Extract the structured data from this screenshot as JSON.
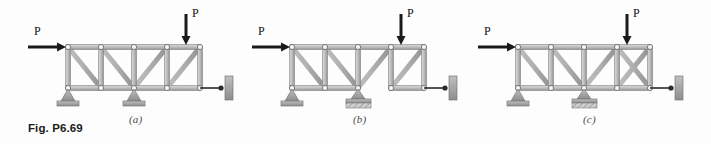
{
  "figure": {
    "caption": "Fig. P6.69",
    "background_color": "#fdfdfd",
    "member_color": "#b9b9b9",
    "member_edge_color": "#7d7d7d",
    "joint_color": "#f2f2f2",
    "support_color": "#9a9a9a",
    "arrow_color": "#1a1a1a"
  },
  "panels": [
    {
      "id": "a",
      "label": "(a)",
      "loads": [
        {
          "name": "horizontal-load",
          "label": "P",
          "direction": "right",
          "applied_at": "top-left-joint"
        },
        {
          "name": "vertical-load",
          "label": "P",
          "direction": "down",
          "applied_at": "top-chord-joint-4"
        }
      ],
      "supports": [
        {
          "type": "pin",
          "position": "bottom-joint-1"
        },
        {
          "type": "pin",
          "position": "bottom-joint-3"
        },
        {
          "type": "link-to-wall",
          "position": "bottom-joint-5"
        }
      ],
      "bottom_chord": "continuous",
      "diagonals": [
        "panel1-down",
        "panel2-down",
        "panel3-up",
        "panel4-up"
      ],
      "verticals": [
        "joint2",
        "joint3",
        "joint4"
      ]
    },
    {
      "id": "b",
      "label": "(b)",
      "loads": [
        {
          "name": "horizontal-load",
          "label": "P",
          "direction": "right",
          "applied_at": "top-left-joint"
        },
        {
          "name": "vertical-load",
          "label": "P",
          "direction": "down",
          "applied_at": "top-chord-joint-4"
        }
      ],
      "supports": [
        {
          "type": "pin",
          "position": "bottom-joint-1"
        },
        {
          "type": "fixed-hatched",
          "position": "bottom-joint-3"
        },
        {
          "type": "link-to-wall",
          "position": "bottom-joint-5"
        }
      ],
      "bottom_chord": "broken-between-joint-3-and-4",
      "diagonals": [
        "panel1-down",
        "panel2-down",
        "panel3-up",
        "panel4-up"
      ],
      "verticals": [
        "joint2",
        "joint3",
        "joint4"
      ]
    },
    {
      "id": "c",
      "label": "(c)",
      "loads": [
        {
          "name": "horizontal-load",
          "label": "P",
          "direction": "right",
          "applied_at": "top-left-joint"
        },
        {
          "name": "vertical-load",
          "label": "P",
          "direction": "down",
          "applied_at": "top-chord-joint-4"
        }
      ],
      "supports": [
        {
          "type": "pin",
          "position": "bottom-joint-1"
        },
        {
          "type": "fixed-hatched",
          "position": "bottom-joint-3"
        },
        {
          "type": "link-to-wall",
          "position": "bottom-joint-5"
        }
      ],
      "bottom_chord": "continuous",
      "diagonals": [
        "panel1-down",
        "panel2-down",
        "panel3-up",
        "panel4-up",
        "panel4-down"
      ],
      "verticals": [
        "joint2",
        "joint3",
        "joint4"
      ]
    }
  ]
}
